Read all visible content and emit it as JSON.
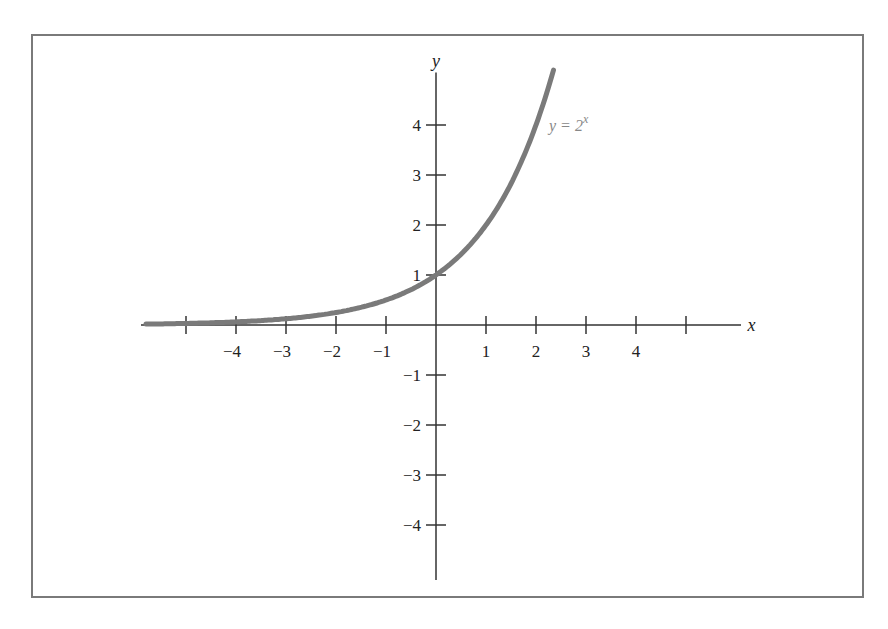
{
  "chart_data": {
    "type": "line",
    "title": "",
    "xlabel": "x",
    "ylabel": "y",
    "xlim": [
      -5.9,
      6.2
    ],
    "ylim": [
      -5.1,
      5.3
    ],
    "grid": false,
    "x_ticks": [
      -5,
      -4,
      -3,
      -2,
      -1,
      1,
      2,
      3,
      4,
      5
    ],
    "x_tick_labels": [
      "",
      "−4",
      "−3",
      "−2",
      "−1",
      "1",
      "2",
      "3",
      "4",
      ""
    ],
    "y_ticks": [
      -4,
      -3,
      -2,
      -1,
      1,
      2,
      3,
      4
    ],
    "y_tick_labels": [
      "−4",
      "−3",
      "−2",
      "−1",
      "1",
      "2",
      "3",
      "4"
    ],
    "series": [
      {
        "name": "y = 2^x",
        "function": "2^x",
        "x": [
          -5.8,
          -5,
          -4,
          -3,
          -2,
          -1,
          0,
          1,
          2,
          2.35
        ],
        "values": [
          0.018,
          0.031,
          0.0625,
          0.125,
          0.25,
          0.5,
          1,
          2,
          4,
          5.1
        ],
        "color": "#7a7a7a"
      }
    ],
    "annotations": [
      {
        "text": "y = 2",
        "superscript": "x",
        "x": 2.3,
        "y": 4
      }
    ]
  },
  "colors": {
    "axis": "#333333",
    "curve": "#7a7a7a",
    "frame": "#7a7a7a",
    "label": "#888888"
  }
}
